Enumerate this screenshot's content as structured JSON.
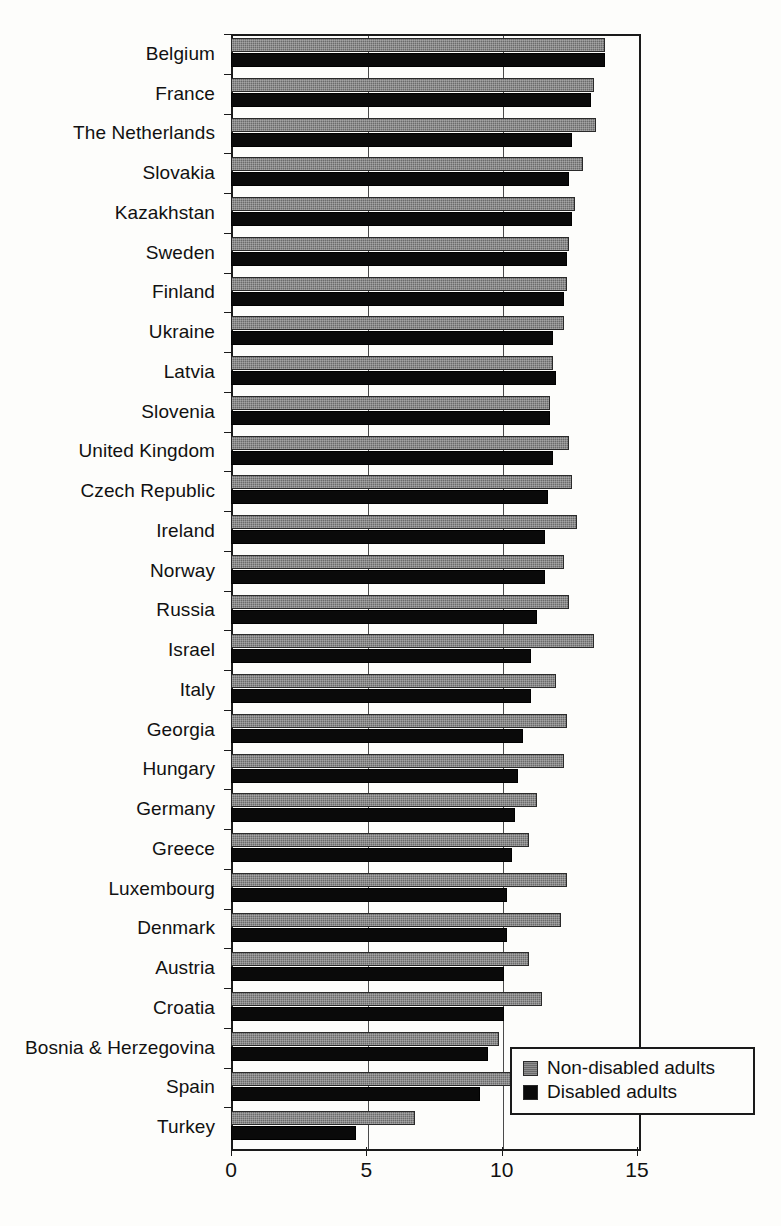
{
  "chart_data": {
    "type": "bar",
    "orientation": "horizontal",
    "title": "",
    "subtitle": "",
    "xlabel": "",
    "ylabel": "",
    "xlim": [
      0,
      15
    ],
    "xticks": [
      0,
      5,
      10,
      15
    ],
    "xticklabels": [
      "0",
      "5",
      "10",
      "15"
    ],
    "grid": true,
    "grid_axis": "x",
    "legend_position": "bottom-right",
    "categories": [
      "Belgium",
      "France",
      "The Netherlands",
      "Slovakia",
      "Kazakhstan",
      "Sweden",
      "Finland",
      "Ukraine",
      "Latvia",
      "Slovenia",
      "United Kingdom",
      "Czech Republic",
      "Ireland",
      "Norway",
      "Russia",
      "Israel",
      "Italy",
      "Georgia",
      "Hungary",
      "Germany",
      "Greece",
      "Luxembourg",
      "Denmark",
      "Austria",
      "Croatia",
      "Bosnia & Herzegovina",
      "Spain",
      "Turkey"
    ],
    "series": [
      {
        "name": "Non-disabled adults",
        "color": "#6b6b6b",
        "values": [
          13.8,
          13.4,
          13.5,
          13.0,
          12.7,
          12.5,
          12.4,
          12.3,
          11.9,
          11.8,
          12.5,
          12.6,
          12.8,
          12.3,
          12.5,
          13.4,
          12.0,
          12.4,
          12.3,
          11.3,
          11.0,
          12.4,
          12.2,
          11.0,
          11.5,
          9.9,
          10.8,
          6.8
        ]
      },
      {
        "name": "Disabled adults",
        "color": "#0a0a0a",
        "values": [
          13.8,
          13.3,
          12.6,
          12.5,
          12.6,
          12.4,
          12.3,
          11.9,
          12.0,
          11.8,
          11.9,
          11.7,
          11.6,
          11.6,
          11.3,
          11.1,
          11.1,
          10.8,
          10.6,
          10.5,
          10.4,
          10.2,
          10.2,
          10.1,
          10.1,
          9.5,
          9.2,
          4.6
        ]
      }
    ]
  },
  "legend": {
    "items": [
      {
        "label": "Non-disabled adults",
        "swatch": "gray-swatch"
      },
      {
        "label": "Disabled adults",
        "swatch": "black-swatch"
      }
    ]
  }
}
